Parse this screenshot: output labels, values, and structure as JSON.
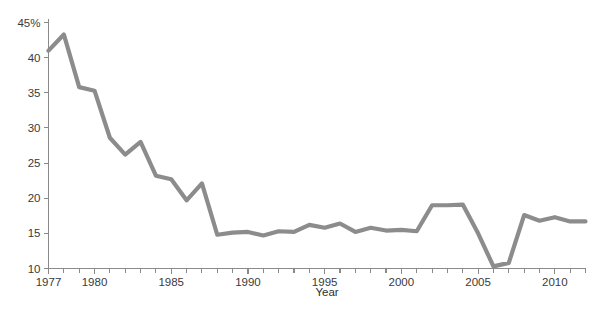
{
  "chart_data": {
    "type": "line",
    "title": "",
    "xlabel": "Year",
    "ylabel": "",
    "xlim": [
      1977,
      2012
    ],
    "ylim": [
      10,
      45
    ],
    "grid": false,
    "legend": null,
    "y_tick_labels": [
      "45%",
      "40",
      "35",
      "30",
      "25",
      "20",
      "15",
      "10"
    ],
    "y_ticks": [
      45,
      40,
      35,
      30,
      25,
      20,
      15,
      10
    ],
    "x_tick_labels": [
      "1977",
      "1980",
      "1985",
      "1990",
      "1995",
      "2000",
      "2005",
      "2010"
    ],
    "x_major_ticks": [
      1977,
      1980,
      1985,
      1990,
      1995,
      2000,
      2005,
      2010
    ],
    "x_minor_tick_interval": 1,
    "series": [
      {
        "name": "series-1",
        "color": "#8c8c8c",
        "x": [
          1977,
          1978,
          1979,
          1980,
          1981,
          1982,
          1983,
          1984,
          1985,
          1986,
          1987,
          1988,
          1989,
          1990,
          1991,
          1992,
          1993,
          1994,
          1995,
          1996,
          1997,
          1998,
          1999,
          2000,
          2001,
          2002,
          2003,
          2004,
          2005,
          2006,
          2007,
          2008,
          2009,
          2010,
          2011,
          2012
        ],
        "values": [
          41.0,
          43.3,
          35.8,
          35.3,
          28.6,
          26.2,
          28.0,
          23.2,
          22.7,
          19.7,
          22.1,
          14.8,
          15.1,
          15.2,
          14.7,
          15.3,
          15.2,
          16.2,
          15.8,
          16.4,
          15.2,
          15.8,
          15.4,
          15.5,
          15.3,
          19.0,
          19.0,
          19.1,
          15.0,
          10.3,
          10.8,
          17.6,
          16.8,
          17.3,
          16.7,
          16.7
        ]
      }
    ]
  },
  "axis": {
    "x_title": "Year"
  },
  "colors": {
    "line": "#8c8c8c",
    "axis": "#8a8a8a",
    "text": "#3a3a3a"
  }
}
